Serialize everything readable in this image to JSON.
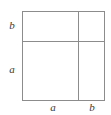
{
  "figure": {
    "line_color": "#8c8c8c",
    "label_color": "#3a3a3a",
    "background_color": "#ffffff"
  },
  "labels": {
    "left_top": "b",
    "left_bottom": "a",
    "bottom_left": "a",
    "bottom_right": "b"
  },
  "chart_data": {
    "type": "diagram",
    "shape": "square",
    "title": "",
    "segments": {
      "horizontal": [
        {
          "label": "a",
          "order": 1
        },
        {
          "label": "b",
          "order": 2
        }
      ],
      "vertical": [
        {
          "label": "b",
          "order": 1
        },
        {
          "label": "a",
          "order": 2
        }
      ]
    },
    "regions": [
      {
        "row": "top",
        "column": "left",
        "width_label": "a",
        "height_label": "b",
        "fill": "none"
      },
      {
        "row": "top",
        "column": "right",
        "width_label": "b",
        "height_label": "b",
        "fill": "none"
      },
      {
        "row": "bottom",
        "column": "left",
        "width_label": "a",
        "height_label": "a",
        "fill": "none"
      },
      {
        "row": "bottom",
        "column": "right",
        "width_label": "b",
        "height_label": "a",
        "fill": "none"
      }
    ],
    "grid": true,
    "legend": "none"
  }
}
